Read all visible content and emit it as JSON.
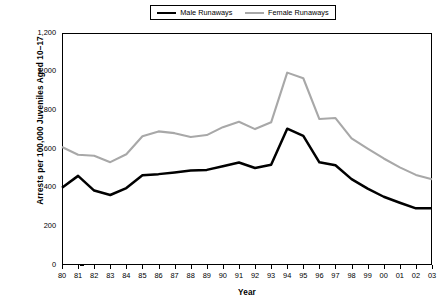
{
  "chart_data": {
    "type": "line",
    "title": "",
    "xlabel": "Year",
    "ylabel": "Arrests per 100,000 Juveniles Aged 10–17",
    "categories": [
      "80",
      "81",
      "82",
      "83",
      "84",
      "85",
      "86",
      "87",
      "88",
      "89",
      "90",
      "91",
      "92",
      "93",
      "94",
      "95",
      "96",
      "97",
      "98",
      "99",
      "00",
      "01",
      "02",
      "03"
    ],
    "x": [
      1980,
      1981,
      1982,
      1983,
      1984,
      1985,
      1986,
      1987,
      1988,
      1989,
      1990,
      1991,
      1992,
      1993,
      1994,
      1995,
      1996,
      1997,
      1998,
      1999,
      2000,
      2001,
      2002,
      2003
    ],
    "ylim": [
      0,
      1200
    ],
    "yticks": [
      0,
      200,
      400,
      600,
      800,
      1000,
      1200
    ],
    "ytick_labels": [
      "0",
      "200",
      "400",
      "600",
      "800",
      "1,000",
      "1,200"
    ],
    "grid": false,
    "legend_position": "top-center",
    "series": [
      {
        "name": "Male Runaways",
        "color": "#000000",
        "values": [
          400,
          461,
          385,
          362,
          398,
          464,
          470,
          479,
          489,
          492,
          511,
          530,
          502,
          518,
          705,
          668,
          531,
          516,
          444,
          395,
          353,
          322,
          293,
          294
        ]
      },
      {
        "name": "Female Runaways",
        "color": "#a8a8a8",
        "values": [
          610,
          570,
          565,
          532,
          573,
          666,
          691,
          682,
          662,
          672,
          713,
          741,
          703,
          738,
          995,
          966,
          755,
          760,
          655,
          602,
          551,
          505,
          466,
          443
        ]
      }
    ]
  },
  "legend": {
    "entries": [
      {
        "label": "Male Runaways",
        "swatch": "male"
      },
      {
        "label": "Female Runaways",
        "swatch": "female"
      }
    ]
  },
  "axes": {
    "y_title": "Arrests per 100,000 Juveniles Aged 10–17",
    "x_title": "Year"
  }
}
